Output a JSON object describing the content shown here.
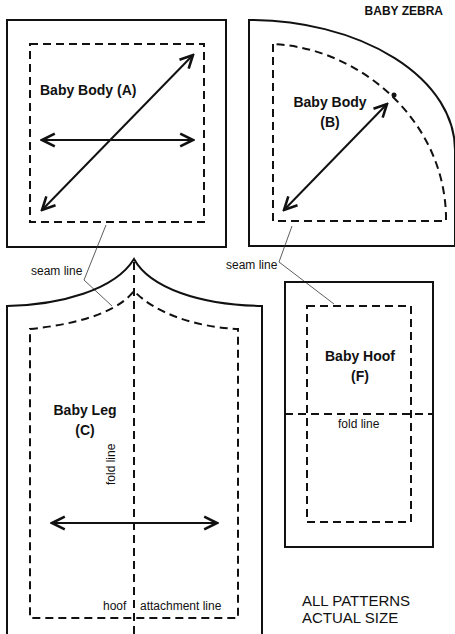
{
  "header": {
    "title": "BABY ZEBRA"
  },
  "pieces": [
    {
      "id": "A",
      "name_line1": "Baby Body (A)",
      "shape": "square"
    },
    {
      "id": "B",
      "name_line1": "Baby Body",
      "name_line2": "(B)",
      "shape": "quarter-circle"
    },
    {
      "id": "C",
      "name_line1": "Baby Leg",
      "name_line2": "(C)",
      "shape": "leg"
    },
    {
      "id": "F",
      "name_line1": "Baby Hoof",
      "name_line2": "(F)",
      "shape": "rectangle"
    }
  ],
  "annotations": {
    "seam_line_left": "seam line",
    "seam_line_right": "seam line",
    "fold_line_leg": "fold line",
    "fold_line_hoof": "fold line",
    "hoof_label": "hoof",
    "attachment_label": "attachment line"
  },
  "footer": {
    "line1": "ALL PATTERNS",
    "line2": "ACTUAL SIZE"
  },
  "colors": {
    "ink": "#111111",
    "paper": "#ffffff"
  }
}
